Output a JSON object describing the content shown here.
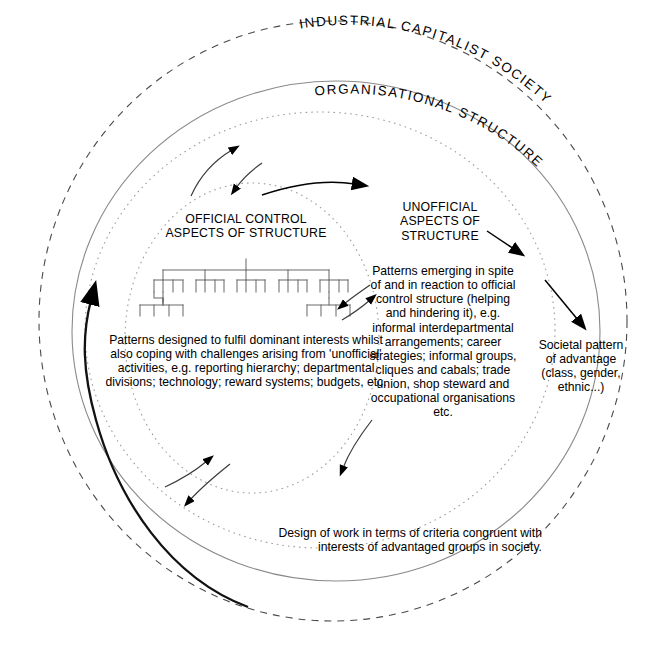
{
  "figure": {
    "type": "concentric-circles-diagram",
    "background_color": "#ffffff",
    "line_color": "#555555",
    "arrow_color": "#000000"
  },
  "outer_ring_label": "INDUSTRIAL CAPITALIST SOCIETY",
  "middle_ring_label": "ORGANISATIONAL STRUCTURE",
  "official": {
    "heading": "OFFICIAL CONTROL\nASPECTS OF STRUCTURE",
    "body": "Patterns designed to fulfil dominant interests whilst also coping with challenges arising from 'unofficial' activities, e.g. reporting hierarchy; departmental divisions; technology; reward systems; budgets, etc."
  },
  "unofficial": {
    "heading": "UNOFFICIAL\nASPECTS OF\nSTRUCTURE",
    "body": "Patterns emerging in spite of and in reaction to official control structure (helping and hindering it), e.g. informal interdepartmental arrangements; career strategies; informal groups, cliques and cabals; trade union, shop steward and occupational organisations etc."
  },
  "societal": {
    "body": "Societal pattern of advantage (class, gender, ethnic...)"
  },
  "design_of_work": {
    "body": "Design of work in terms of criteria congruent with interests of advantaged groups in society."
  },
  "arrows": [
    {
      "name": "official-to-unofficial-upper-a",
      "direction": "up-right"
    },
    {
      "name": "official-to-unofficial-upper-b",
      "direction": "up-right"
    },
    {
      "name": "official-to-unofficial-main",
      "direction": "right"
    },
    {
      "name": "unofficial-to-societal-upper",
      "direction": "down-right"
    },
    {
      "name": "unofficial-to-societal-lower",
      "direction": "down-right"
    },
    {
      "name": "mutual-influence-left",
      "direction": "down-left"
    },
    {
      "name": "mutual-influence-right",
      "direction": "up-right"
    },
    {
      "name": "bottom-feedback-up",
      "direction": "up-right"
    },
    {
      "name": "bottom-feedback-down",
      "direction": "down-left"
    },
    {
      "name": "society-to-structure-heavy",
      "direction": "up"
    }
  ]
}
